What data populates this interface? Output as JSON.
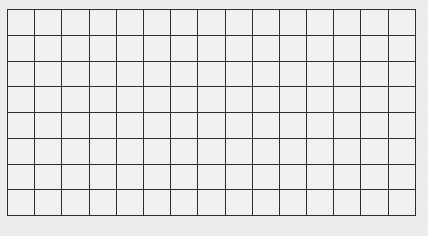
{
  "page": {
    "width": 428,
    "height": 236,
    "background_color": "#eeeeee"
  },
  "grid": {
    "name": "blank-grid",
    "rows": 8,
    "columns": 15,
    "cell_text": "",
    "clipped_right": true,
    "origin_x": 7,
    "origin_y": 9,
    "cell_width": 27.2,
    "cell_height": 25.75,
    "line_color": "#2e2e2e",
    "line_width": 2.6,
    "cell_fill_color": "#f2f2f2",
    "outer_border_color": "#262626"
  },
  "chart_data": {
    "type": "table",
    "title": "",
    "xlabel": "",
    "ylabel": "",
    "columns": [
      "1",
      "2",
      "3",
      "4",
      "5",
      "6",
      "7",
      "8",
      "9",
      "10",
      "11",
      "12",
      "13",
      "14",
      "15"
    ],
    "row_labels": [
      "1",
      "2",
      "3",
      "4",
      "5",
      "6",
      "7",
      "8"
    ],
    "values": [
      [
        "",
        "",
        "",
        "",
        "",
        "",
        "",
        "",
        "",
        "",
        "",
        "",
        "",
        "",
        ""
      ],
      [
        "",
        "",
        "",
        "",
        "",
        "",
        "",
        "",
        "",
        "",
        "",
        "",
        "",
        "",
        ""
      ],
      [
        "",
        "",
        "",
        "",
        "",
        "",
        "",
        "",
        "",
        "",
        "",
        "",
        "",
        "",
        ""
      ],
      [
        "",
        "",
        "",
        "",
        "",
        "",
        "",
        "",
        "",
        "",
        "",
        "",
        "",
        "",
        ""
      ],
      [
        "",
        "",
        "",
        "",
        "",
        "",
        "",
        "",
        "",
        "",
        "",
        "",
        "",
        "",
        ""
      ],
      [
        "",
        "",
        "",
        "",
        "",
        "",
        "",
        "",
        "",
        "",
        "",
        "",
        "",
        "",
        ""
      ],
      [
        "",
        "",
        "",
        "",
        "",
        "",
        "",
        "",
        "",
        "",
        "",
        "",
        "",
        "",
        ""
      ],
      [
        "",
        "",
        "",
        "",
        "",
        "",
        "",
        "",
        "",
        "",
        "",
        "",
        "",
        "",
        ""
      ]
    ],
    "grid": true,
    "legend": null
  }
}
